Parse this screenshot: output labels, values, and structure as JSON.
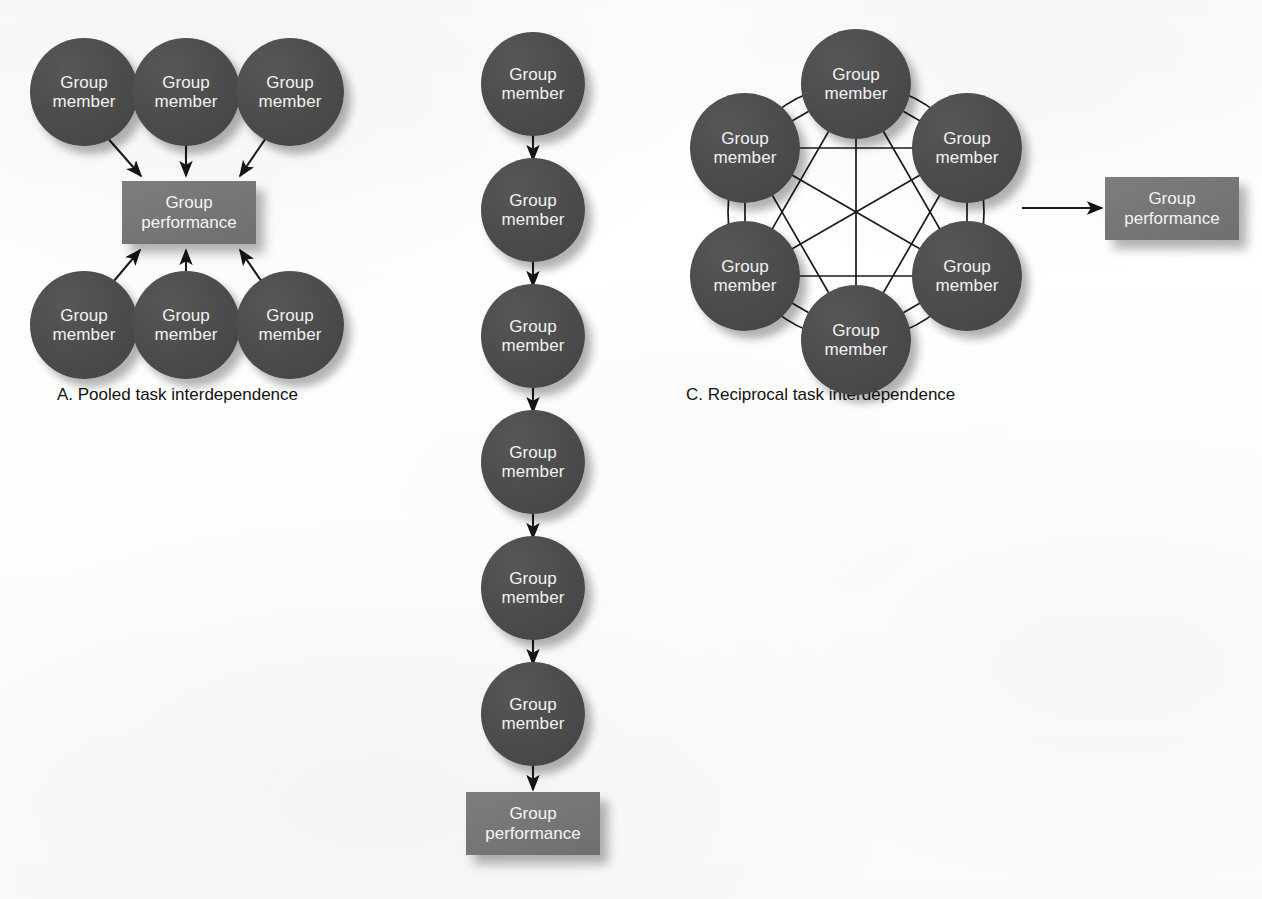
{
  "figure": {
    "background_color": "#fdfdfd",
    "node_color": "#4a4a4a",
    "box_color": "#787878",
    "node_text_color": "#f2f2f2",
    "edge_color": "#1a1a1a",
    "caption_color": "#121212"
  },
  "labels": {
    "member_line1": "Group",
    "member_line2": "member",
    "performance_line1": "Group",
    "performance_line2": "performance"
  },
  "panels": [
    {
      "id": "a",
      "caption": "A. Pooled task interdependence",
      "caption_x": 57,
      "caption_y": 385,
      "caption_font_size": 17,
      "members": [
        {
          "name": "member-a-top-left",
          "cx": 84,
          "cy": 92,
          "r": 54,
          "font_size": 17
        },
        {
          "name": "member-a-top-center",
          "cx": 186,
          "cy": 92,
          "r": 54,
          "font_size": 17
        },
        {
          "name": "member-a-top-right",
          "cx": 290,
          "cy": 92,
          "r": 54,
          "font_size": 17
        },
        {
          "name": "member-a-bottom-left",
          "cx": 84,
          "cy": 325,
          "r": 54,
          "font_size": 17
        },
        {
          "name": "member-a-bottom-center",
          "cx": 186,
          "cy": 325,
          "r": 54,
          "font_size": 17
        },
        {
          "name": "member-a-bottom-right",
          "cx": 290,
          "cy": 325,
          "r": 54,
          "font_size": 17
        }
      ],
      "performance_box": {
        "x": 122,
        "y": 181,
        "w": 134,
        "h": 63,
        "font_size": 17
      },
      "arrows": [
        {
          "x1": 105,
          "y1": 135,
          "x2": 141,
          "y2": 176
        },
        {
          "x1": 186,
          "y1": 146,
          "x2": 186,
          "y2": 176
        },
        {
          "x1": 268,
          "y1": 135,
          "x2": 240,
          "y2": 176
        },
        {
          "x1": 108,
          "y1": 288,
          "x2": 140,
          "y2": 250
        },
        {
          "x1": 186,
          "y1": 280,
          "x2": 186,
          "y2": 250
        },
        {
          "x1": 266,
          "y1": 288,
          "x2": 240,
          "y2": 250
        }
      ]
    },
    {
      "id": "b",
      "caption": "",
      "members": [
        {
          "name": "member-b-1",
          "cx": 533,
          "cy": 84,
          "r": 52,
          "font_size": 17
        },
        {
          "name": "member-b-2",
          "cx": 533,
          "cy": 210,
          "r": 52,
          "font_size": 17
        },
        {
          "name": "member-b-3",
          "cx": 533,
          "cy": 336,
          "r": 52,
          "font_size": 17
        },
        {
          "name": "member-b-4",
          "cx": 533,
          "cy": 462,
          "r": 52,
          "font_size": 17
        },
        {
          "name": "member-b-5",
          "cx": 533,
          "cy": 588,
          "r": 52,
          "font_size": 17
        },
        {
          "name": "member-b-6",
          "cx": 533,
          "cy": 714,
          "r": 52,
          "font_size": 17
        }
      ],
      "performance_box": {
        "x": 466,
        "y": 792,
        "w": 134,
        "h": 63,
        "font_size": 17
      },
      "arrows": [
        {
          "x1": 533,
          "y1": 134,
          "x2": 533,
          "y2": 160
        },
        {
          "x1": 533,
          "y1": 260,
          "x2": 533,
          "y2": 286
        },
        {
          "x1": 533,
          "y1": 386,
          "x2": 533,
          "y2": 412
        },
        {
          "x1": 533,
          "y1": 512,
          "x2": 533,
          "y2": 538
        },
        {
          "x1": 533,
          "y1": 638,
          "x2": 533,
          "y2": 664
        },
        {
          "x1": 533,
          "y1": 764,
          "x2": 533,
          "y2": 790
        }
      ]
    },
    {
      "id": "c",
      "caption": "C. Reciprocal task interdependence",
      "caption_x": 686,
      "caption_y": 385,
      "caption_font_size": 17,
      "ring_center_x": 856,
      "ring_center_y": 212,
      "ring_radius": 128,
      "members": [
        {
          "name": "member-c-top",
          "cx": 856,
          "cy": 84,
          "r": 55,
          "font_size": 17
        },
        {
          "name": "member-c-upper-right",
          "cx": 967,
          "cy": 148,
          "r": 55,
          "font_size": 17
        },
        {
          "name": "member-c-lower-right",
          "cx": 967,
          "cy": 276,
          "r": 55,
          "font_size": 17
        },
        {
          "name": "member-c-bottom",
          "cx": 856,
          "cy": 340,
          "r": 55,
          "font_size": 17
        },
        {
          "name": "member-c-lower-left",
          "cx": 745,
          "cy": 276,
          "r": 55,
          "font_size": 17
        },
        {
          "name": "member-c-upper-left",
          "cx": 745,
          "cy": 148,
          "r": 55,
          "font_size": 17
        }
      ],
      "performance_box": {
        "x": 1105,
        "y": 177,
        "w": 134,
        "h": 63,
        "font_size": 17
      },
      "arrows": [
        {
          "x1": 1022,
          "y1": 208,
          "x2": 1102,
          "y2": 208
        }
      ]
    }
  ],
  "chart_data": {
    "type": "diagram",
    "panels": [
      {
        "label": "A",
        "caption": "A. Pooled task interdependence",
        "node_count": 6,
        "node_label": "Group member",
        "sink_label": "Group performance",
        "topology": "six independent members each send one arrow into a shared Group performance box; no member-to-member links",
        "edges": [
          [
            "member 1",
            "Group performance"
          ],
          [
            "member 2",
            "Group performance"
          ],
          [
            "member 3",
            "Group performance"
          ],
          [
            "member 4",
            "Group performance"
          ],
          [
            "member 5",
            "Group performance"
          ],
          [
            "member 6",
            "Group performance"
          ]
        ]
      },
      {
        "label": "B",
        "caption": "",
        "node_count": 6,
        "node_label": "Group member",
        "sink_label": "Group performance",
        "topology": "serial chain: each member feeds the next, the last feeds Group performance",
        "edges": [
          [
            "member 1",
            "member 2"
          ],
          [
            "member 2",
            "member 3"
          ],
          [
            "member 3",
            "member 4"
          ],
          [
            "member 4",
            "member 5"
          ],
          [
            "member 5",
            "member 6"
          ],
          [
            "member 6",
            "Group performance"
          ]
        ]
      },
      {
        "label": "C",
        "caption": "C. Reciprocal task interdependence",
        "node_count": 6,
        "node_label": "Group member",
        "sink_label": "Group performance",
        "topology": "six members arranged in a ring, fully interconnected (complete graph, 15 links), with a single arrow from the ring to Group performance",
        "edges": [
          [
            "member 1",
            "member 2"
          ],
          [
            "member 1",
            "member 3"
          ],
          [
            "member 1",
            "member 4"
          ],
          [
            "member 1",
            "member 5"
          ],
          [
            "member 1",
            "member 6"
          ],
          [
            "member 2",
            "member 3"
          ],
          [
            "member 2",
            "member 4"
          ],
          [
            "member 2",
            "member 5"
          ],
          [
            "member 2",
            "member 6"
          ],
          [
            "member 3",
            "member 4"
          ],
          [
            "member 3",
            "member 5"
          ],
          [
            "member 3",
            "member 6"
          ],
          [
            "member 4",
            "member 5"
          ],
          [
            "member 4",
            "member 6"
          ],
          [
            "member 5",
            "member 6"
          ],
          [
            "ring",
            "Group performance"
          ]
        ]
      }
    ]
  }
}
